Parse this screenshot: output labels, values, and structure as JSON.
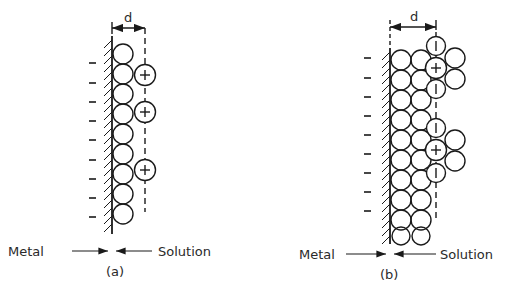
{
  "panels": [
    {
      "id": "a",
      "caption": "(a)",
      "dimension_label": "d",
      "left_label": "Metal",
      "right_label": "Solution",
      "minus_count": 9,
      "cation_count": 3,
      "solvent_layers": 1
    },
    {
      "id": "b",
      "caption": "(b)",
      "dimension_label": "d",
      "left_label": "Metal",
      "right_label": "Solution",
      "minus_count": 9,
      "cation_count": 2,
      "anion_count": 4,
      "solvent_layers": 2
    }
  ],
  "colors": {
    "ink": "#1a1a1a",
    "background": "#ffffff"
  }
}
